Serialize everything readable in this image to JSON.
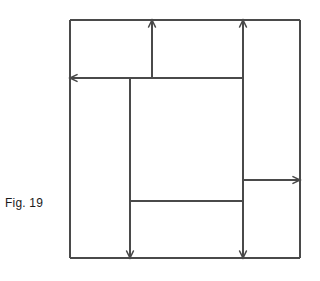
{
  "figure": {
    "caption": "Fig. 19",
    "stroke_color": "#4a4a4a",
    "caption_color": "#1a1a1a",
    "background_color": "#ffffff",
    "stroke_width": 1.1,
    "outer_rect": {
      "x": 70,
      "y": 20,
      "width": 230,
      "height": 238
    },
    "segments": [
      {
        "name": "outer-top",
        "x1": 70,
        "y1": 20,
        "x2": 300,
        "y2": 20
      },
      {
        "name": "outer-left",
        "x1": 70,
        "y1": 20,
        "x2": 70,
        "y2": 258
      },
      {
        "name": "outer-right",
        "x1": 300,
        "y1": 20,
        "x2": 300,
        "y2": 258
      },
      {
        "name": "outer-bottom",
        "x1": 70,
        "y1": 258,
        "x2": 300,
        "y2": 258
      },
      {
        "name": "divider-vertical-top-middle",
        "x1": 152,
        "y1": 20,
        "x2": 152,
        "y2": 78
      },
      {
        "name": "divider-vertical-right",
        "x1": 243,
        "y1": 20,
        "x2": 243,
        "y2": 258
      },
      {
        "name": "divider-horizontal-upper",
        "x1": 70,
        "y1": 78,
        "x2": 243,
        "y2": 78
      },
      {
        "name": "divider-vertical-center",
        "x1": 130,
        "y1": 78,
        "x2": 130,
        "y2": 258
      },
      {
        "name": "divider-horizontal-lower",
        "x1": 130,
        "y1": 201,
        "x2": 243,
        "y2": 201
      },
      {
        "name": "divider-horizontal-right",
        "x1": 243,
        "y1": 180,
        "x2": 300,
        "y2": 180
      }
    ],
    "arrow_markers": [
      {
        "name": "arrow-top-middle",
        "x": 152,
        "y": 20,
        "direction": "up"
      },
      {
        "name": "arrow-top-right",
        "x": 243,
        "y": 20,
        "direction": "up"
      },
      {
        "name": "arrow-left",
        "x": 70,
        "y": 78,
        "direction": "left"
      },
      {
        "name": "arrow-right",
        "x": 300,
        "y": 180,
        "direction": "right"
      },
      {
        "name": "arrow-bottom-center",
        "x": 130,
        "y": 258,
        "direction": "down"
      },
      {
        "name": "arrow-bottom-right",
        "x": 243,
        "y": 258,
        "direction": "down"
      }
    ]
  }
}
